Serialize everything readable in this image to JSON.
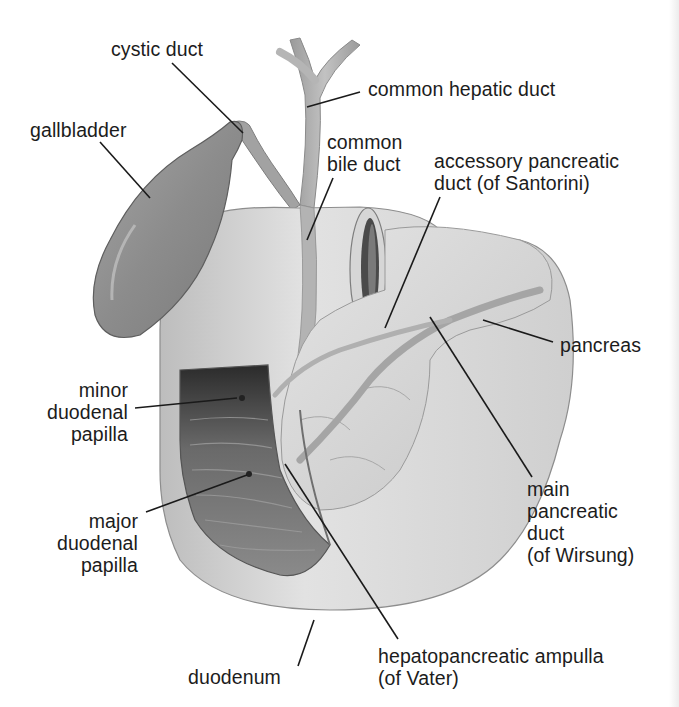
{
  "diagram": {
    "type": "anatomical illustration",
    "labels": {
      "cystic_duct": "cystic duct",
      "common_hepatic_duct": "common hepatic duct",
      "gallbladder": "gallbladder",
      "common_bile_duct": "common\nbile duct",
      "accessory_pancreatic_duct": "accessory pancreatic\nduct (of Santorini)",
      "pancreas": "pancreas",
      "minor_duodenal_papilla": "minor\nduodenal\npapilla",
      "major_duodenal_papilla": "major\nduodenal\npapilla",
      "main_pancreatic_duct": "main\npancreatic\nduct\n(of Wirsung)",
      "duodenum": "duodenum",
      "hepatopancreatic_ampulla": "hepatopancreatic ampulla\n(of Vater)"
    },
    "colors": {
      "background": "#ffffff",
      "text": "#1c1c1c",
      "leader_line": "#1a1a1a",
      "gallbladder": "#8f8f8f",
      "ducts": "#a9a9a9",
      "duodenum_wall": "#cfcfcf",
      "lumen_dark": "#3a3a3a",
      "pancreas": "#d9d9d9"
    }
  }
}
